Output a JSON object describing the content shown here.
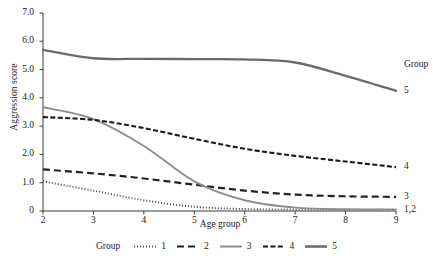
{
  "chart_data": {
    "type": "line",
    "title": "",
    "xlabel": "Age group",
    "ylabel": "Aggression score",
    "xlim": [
      2,
      9
    ],
    "ylim": [
      0,
      7
    ],
    "grid": false,
    "legend_position": "bottom",
    "legend_title": "Group",
    "x_ticks": [
      "2",
      "3",
      "4",
      "5",
      "6",
      "7",
      "8",
      "9"
    ],
    "y_ticks": [
      "0",
      "1.0",
      "2.0",
      "3.0",
      "4.0",
      "5.0",
      "6.0",
      "7.0"
    ],
    "x": [
      2,
      3,
      4,
      5,
      6,
      7,
      8,
      9
    ],
    "series": [
      {
        "name": "1",
        "label": "1",
        "style": "dotted",
        "color": "#555555",
        "values": [
          1.05,
          0.72,
          0.38,
          0.15,
          0.07,
          0.05,
          0.05,
          0.05
        ]
      },
      {
        "name": "2",
        "label": "2",
        "style": "dashed",
        "color": "#222222",
        "values": [
          1.47,
          1.33,
          1.15,
          0.93,
          0.72,
          0.58,
          0.52,
          0.5
        ]
      },
      {
        "name": "3",
        "label": "3",
        "style": "solid-light",
        "color": "#8d8d8d",
        "values": [
          3.67,
          3.25,
          2.3,
          1.05,
          0.38,
          0.12,
          0.06,
          0.05
        ]
      },
      {
        "name": "4",
        "label": "4",
        "style": "dash-dot",
        "color": "#1b1b1b",
        "values": [
          3.32,
          3.22,
          2.93,
          2.55,
          2.2,
          1.95,
          1.75,
          1.55
        ]
      },
      {
        "name": "5",
        "label": "5",
        "style": "solid-thick",
        "color": "#6a6a6a",
        "values": [
          5.7,
          5.4,
          5.38,
          5.37,
          5.36,
          5.25,
          4.78,
          4.25
        ]
      }
    ],
    "right_annotations": [
      {
        "text": "Group",
        "y": 5.15
      },
      {
        "text": "5",
        "y": 4.25
      },
      {
        "text": "4",
        "y": 1.55
      },
      {
        "text": "3",
        "y": 0.5
      },
      {
        "text": "1,2",
        "y": 0.05
      }
    ]
  }
}
